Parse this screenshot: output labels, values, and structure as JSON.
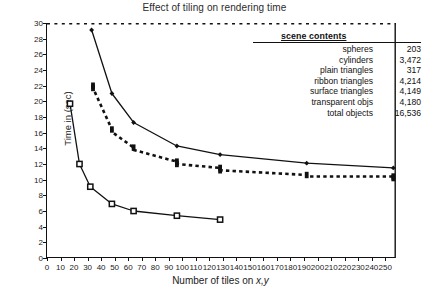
{
  "chart_data": {
    "type": "line",
    "title": "Effect of tiling on rendering time",
    "xlabel": "Number of tiles on x,y",
    "ylabel": "Time in (sec)",
    "xlim": [
      0,
      258
    ],
    "ylim": [
      0,
      30
    ],
    "grid": false,
    "legend_position": "none",
    "xticks": [
      0,
      10,
      20,
      30,
      40,
      50,
      60,
      70,
      80,
      90,
      100,
      110,
      120,
      130,
      140,
      150,
      160,
      170,
      180,
      190,
      200,
      210,
      220,
      230,
      240,
      250
    ],
    "yticks": [
      0,
      2,
      4,
      6,
      8,
      10,
      12,
      14,
      16,
      18,
      20,
      22,
      24,
      26,
      28,
      30
    ],
    "series": [
      {
        "name": "upper-solid-diamond",
        "style": "solid",
        "marker": "diamond",
        "points": [
          {
            "x": 33,
            "y": 29.1
          },
          {
            "x": 48,
            "y": 21.0
          },
          {
            "x": 64,
            "y": 17.3
          },
          {
            "x": 96,
            "y": 14.3
          },
          {
            "x": 128,
            "y": 13.2
          },
          {
            "x": 192,
            "y": 12.1
          },
          {
            "x": 256,
            "y": 11.5
          }
        ]
      },
      {
        "name": "middle-dashed-square",
        "style": "dashed",
        "marker": "filled-square",
        "points": [
          {
            "x": 34,
            "y": 22.0
          },
          {
            "x": 34,
            "y": 21.7
          },
          {
            "x": 48,
            "y": 16.4
          },
          {
            "x": 48,
            "y": 16.1
          },
          {
            "x": 64,
            "y": 14.1
          },
          {
            "x": 64,
            "y": 13.8
          },
          {
            "x": 96,
            "y": 12.3
          },
          {
            "x": 96,
            "y": 12.0
          },
          {
            "x": 128,
            "y": 11.5
          },
          {
            "x": 128,
            "y": 11.2
          },
          {
            "x": 192,
            "y": 10.6
          },
          {
            "x": 192,
            "y": 10.4
          },
          {
            "x": 256,
            "y": 10.4
          },
          {
            "x": 256,
            "y": 10.2
          }
        ]
      },
      {
        "name": "lower-solid-open-square",
        "style": "solid",
        "marker": "open-square",
        "points": [
          {
            "x": 17,
            "y": 19.7
          },
          {
            "x": 24,
            "y": 12.0
          },
          {
            "x": 32,
            "y": 9.1
          },
          {
            "x": 48,
            "y": 6.9
          },
          {
            "x": 64,
            "y": 6.0
          },
          {
            "x": 96,
            "y": 5.4
          },
          {
            "x": 128,
            "y": 4.9
          }
        ]
      }
    ],
    "annotations": {
      "scene_contents": {
        "heading": "scene contents",
        "rows": [
          {
            "label": "spheres",
            "value": "203"
          },
          {
            "label": "cylinders",
            "value": "3,472"
          },
          {
            "label": "plain triangles",
            "value": "317"
          },
          {
            "label": "ribbon triangles",
            "value": "4,214"
          },
          {
            "label": "surface triangles",
            "value": "4,149"
          },
          {
            "label": "transparent objs",
            "value": "4,180"
          },
          {
            "label": "total objects",
            "value": "16,536"
          }
        ]
      }
    },
    "colors": {
      "axis": "#111111",
      "line": "#111111",
      "background": "#ffffff"
    }
  }
}
